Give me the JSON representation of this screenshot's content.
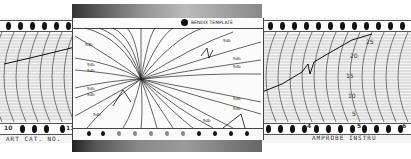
{
  "left_strip": {
    "bottom_numbers": [
      "10",
      "11"
    ],
    "bottom_text": "ART CAT. NO."
  },
  "overlay": {
    "header_text": "BENDIX   TEMPLATE",
    "line_labels": [
      "5db",
      "5db",
      "5db",
      "5db",
      "5db",
      "5db",
      "5db",
      "5db",
      "5db",
      "5db",
      "5db",
      "5db"
    ]
  },
  "right_strip": {
    "scale_labels": [
      "25",
      "20",
      "15",
      "10",
      "5"
    ],
    "bottom_numbers": [
      "4",
      "5",
      "6"
    ],
    "bottom_text": "AMPROBE INSTRU"
  },
  "colors": {
    "ink": "#111111",
    "paper": "#f4f4f4",
    "frame_dark": "#333333"
  }
}
